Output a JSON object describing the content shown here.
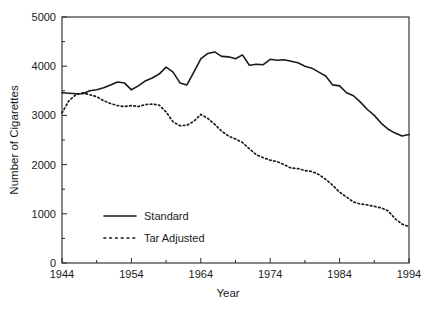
{
  "chart_data": {
    "type": "line",
    "title": "",
    "xlabel": "Year",
    "ylabel": "Number of Cigarettes",
    "xlim": [
      1944,
      1994
    ],
    "ylim": [
      0,
      5000
    ],
    "grid": false,
    "legend_position": "center-left",
    "x_ticks": [
      1944,
      1954,
      1964,
      1974,
      1984,
      1994
    ],
    "x_tick_labels": [
      "1944",
      "1954",
      "1964",
      "1974",
      "1984",
      "1994"
    ],
    "x_minor_ticks": [
      1949,
      1959,
      1969,
      1979,
      1989
    ],
    "y_ticks": [
      0,
      1000,
      2000,
      3000,
      4000,
      5000
    ],
    "y_tick_labels": [
      "0",
      "1000",
      "2000",
      "3000",
      "4000",
      "5000"
    ],
    "y_minor_ticks": [
      500,
      1500,
      2500,
      3500,
      4500
    ],
    "x": [
      1944,
      1945,
      1946,
      1947,
      1948,
      1949,
      1950,
      1951,
      1952,
      1953,
      1954,
      1955,
      1956,
      1957,
      1958,
      1959,
      1960,
      1961,
      1962,
      1963,
      1964,
      1965,
      1966,
      1967,
      1968,
      1969,
      1970,
      1971,
      1972,
      1973,
      1974,
      1975,
      1976,
      1977,
      1978,
      1979,
      1980,
      1981,
      1982,
      1983,
      1984,
      1985,
      1986,
      1987,
      1988,
      1989,
      1990,
      1991,
      1992,
      1993,
      1994
    ],
    "series": [
      {
        "name": "Standard",
        "style": "solid",
        "color": "#1a1a1a",
        "values": [
          3460,
          3450,
          3440,
          3440,
          3500,
          3520,
          3560,
          3620,
          3680,
          3660,
          3520,
          3600,
          3700,
          3760,
          3840,
          3980,
          3880,
          3660,
          3620,
          3880,
          4150,
          4260,
          4290,
          4200,
          4190,
          4150,
          4230,
          4020,
          4040,
          4030,
          4140,
          4120,
          4130,
          4100,
          4070,
          4000,
          3960,
          3880,
          3800,
          3620,
          3600,
          3460,
          3400,
          3270,
          3120,
          3000,
          2840,
          2720,
          2640,
          2580,
          2610
        ],
        "points_px": []
      },
      {
        "name": "Tar Adjusted",
        "style": "dotted",
        "color": "#1a1a1a",
        "values": [
          3050,
          3300,
          3420,
          3460,
          3420,
          3380,
          3300,
          3240,
          3200,
          3180,
          3200,
          3180,
          3220,
          3230,
          3210,
          3070,
          2870,
          2790,
          2800,
          2880,
          3020,
          2940,
          2820,
          2680,
          2580,
          2520,
          2450,
          2320,
          2200,
          2140,
          2090,
          2060,
          2000,
          1930,
          1920,
          1880,
          1860,
          1800,
          1700,
          1580,
          1440,
          1340,
          1240,
          1200,
          1180,
          1150,
          1120,
          1060,
          900,
          790,
          740
        ],
        "points_px": []
      }
    ],
    "legend": [
      {
        "label": "Standard",
        "style": "solid"
      },
      {
        "label": "Tar Adjusted",
        "style": "dotted"
      }
    ]
  }
}
